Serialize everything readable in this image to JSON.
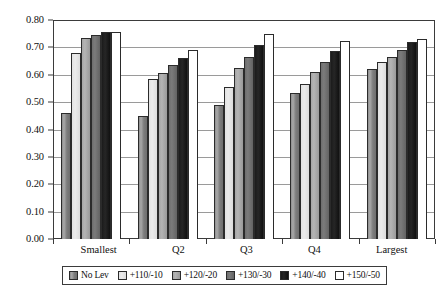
{
  "chart_data": {
    "type": "bar",
    "title": "",
    "subtitle": "",
    "xlabel": "",
    "ylabel": "",
    "categories": [
      "Smallest",
      "Q2",
      "Q3",
      "Q4",
      "Largest"
    ],
    "series": [
      {
        "name": "No Lev",
        "color": "#8e8e8e",
        "values": [
          0.46,
          0.45,
          0.49,
          0.535,
          0.62
        ]
      },
      {
        "name": "+110/-10",
        "color": "#e6e6e6",
        "values": [
          0.68,
          0.585,
          0.555,
          0.565,
          0.645
        ]
      },
      {
        "name": "+120/-20",
        "color": "#ababab",
        "values": [
          0.735,
          0.605,
          0.625,
          0.61,
          0.665
        ]
      },
      {
        "name": "+130/-30",
        "color": "#707070",
        "values": [
          0.745,
          0.635,
          0.665,
          0.645,
          0.69
        ]
      },
      {
        "name": "+140/-40",
        "color": "#1b1b1b",
        "values": [
          0.755,
          0.66,
          0.71,
          0.685,
          0.72
        ]
      },
      {
        "name": "+150/-50",
        "color": "#ffffff",
        "values": [
          0.755,
          0.69,
          0.75,
          0.725,
          0.73
        ]
      }
    ],
    "ylim": [
      0.0,
      0.8
    ],
    "ytick_labels": [
      "0.80",
      "0.70",
      "0.60",
      "0.50",
      "0.40",
      "0.30",
      "0.20",
      "0.10",
      "0.00"
    ],
    "ytick_values": [
      0.8,
      0.7,
      0.6,
      0.5,
      0.4,
      0.3,
      0.2,
      0.1,
      0.0
    ],
    "grid": true,
    "legend_position": "bottom"
  },
  "legend": {
    "items": [
      {
        "label": "No Lev"
      },
      {
        "label": "+110/-10"
      },
      {
        "label": "+120/-20"
      },
      {
        "label": "+130/-30"
      },
      {
        "label": "+140/-40"
      },
      {
        "label": "+150/-50"
      }
    ]
  }
}
